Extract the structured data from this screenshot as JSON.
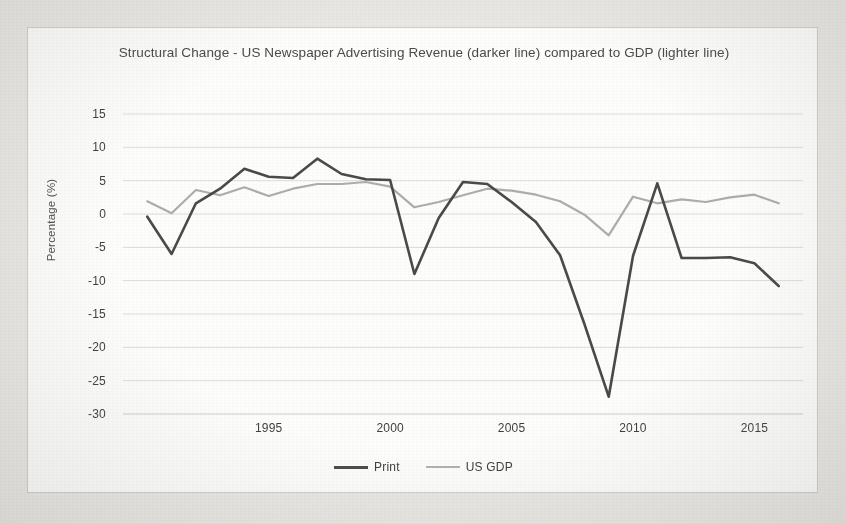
{
  "card": {
    "title": "Structural Change - US Newspaper Advertising Revenue (darker line) compared to GDP (lighter line)"
  },
  "legend": {
    "items": [
      {
        "label": "Print",
        "color": "#4a4a4a"
      },
      {
        "label": "US GDP",
        "color": "#adadad"
      }
    ]
  },
  "chart_data": {
    "type": "line",
    "title": "Structural Change - US Newspaper Advertising Revenue (darker line) compared to GDP (lighter line)",
    "xlabel": "",
    "ylabel": "Percentage (%)",
    "xlim": [
      1989,
      2017
    ],
    "ylim": [
      -30,
      15
    ],
    "ytick_labels": [
      "15",
      "10",
      "5",
      "0",
      "-5",
      "-10",
      "-15",
      "-20",
      "-25",
      "-30"
    ],
    "yticks": [
      15,
      10,
      5,
      0,
      -5,
      -10,
      -15,
      -20,
      -25,
      -30
    ],
    "xtick_labels": [
      "1995",
      "2000",
      "2005",
      "2010",
      "2015"
    ],
    "xticks": [
      1995,
      2000,
      2005,
      2010,
      2015
    ],
    "grid": true,
    "legend_position": "bottom",
    "x": [
      1990,
      1991,
      1992,
      1993,
      1994,
      1995,
      1996,
      1997,
      1998,
      1999,
      2000,
      2001,
      2002,
      2003,
      2004,
      2005,
      2006,
      2007,
      2008,
      2009,
      2010,
      2011,
      2012,
      2013,
      2014,
      2015,
      2016
    ],
    "series": [
      {
        "name": "Print",
        "color": "#4a4a4a",
        "values": [
          -0.4,
          -6.0,
          1.6,
          3.8,
          6.8,
          5.6,
          5.4,
          8.3,
          6.0,
          5.2,
          5.1,
          -9.0,
          -0.6,
          4.8,
          4.5,
          1.8,
          -1.2,
          -6.2,
          -16.5,
          -27.4,
          -6.3,
          4.6,
          -6.6,
          -6.6,
          -6.5,
          -7.4,
          -10.8
        ]
      },
      {
        "name": "US GDP",
        "color": "#adadad",
        "values": [
          1.9,
          0.1,
          3.6,
          2.8,
          4.0,
          2.7,
          3.8,
          4.5,
          4.5,
          4.8,
          4.1,
          1.0,
          1.8,
          2.8,
          3.8,
          3.5,
          2.9,
          1.9,
          -0.1,
          -3.2,
          2.6,
          1.6,
          2.2,
          1.8,
          2.5,
          2.9,
          1.6
        ]
      }
    ]
  },
  "axes": {
    "y_title": "Percentage (%)"
  }
}
